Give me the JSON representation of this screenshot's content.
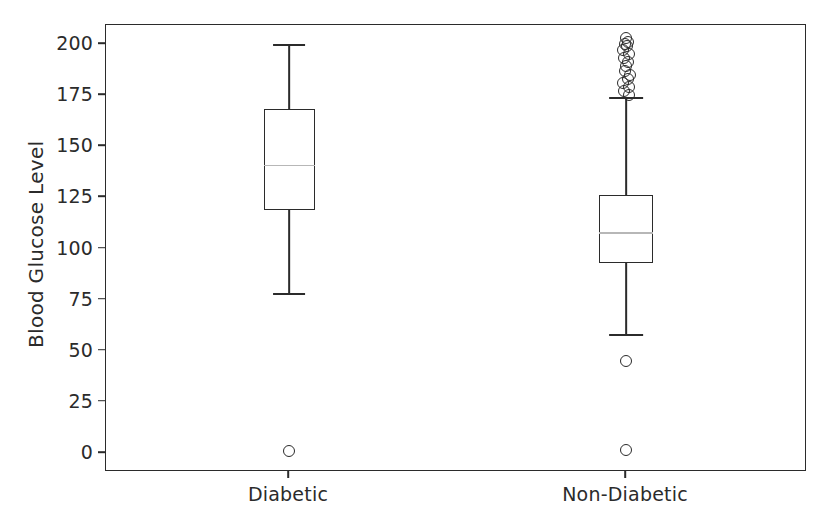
{
  "chart_data": {
    "type": "box",
    "title": "",
    "xlabel": "",
    "ylabel": "Blood Glucose Level",
    "categories": [
      "Diabetic",
      "Non-Diabetic"
    ],
    "ylim": [
      -10,
      209
    ],
    "yticks": [
      0,
      25,
      50,
      75,
      100,
      125,
      150,
      175,
      200
    ],
    "ytick_labels": [
      "0",
      "25",
      "50",
      "75",
      "100",
      "125",
      "150",
      "175",
      "200"
    ],
    "grid": false,
    "legend": null,
    "median_color": "#b7b7b7",
    "box_color": "#2b2b2b",
    "series": [
      {
        "name": "Diabetic",
        "whisker_low": 78,
        "q1": 119,
        "median": 141,
        "q3": 168,
        "whisker_high": 200,
        "outliers": [
          1
        ]
      },
      {
        "name": "Non-Diabetic",
        "whisker_low": 58,
        "q1": 93,
        "median": 108,
        "q3": 126,
        "whisker_high": 174,
        "outliers": [
          1.5,
          45,
          175,
          177,
          179,
          181,
          183,
          185,
          187,
          189,
          191,
          193,
          195,
          197,
          199,
          200,
          201,
          203
        ]
      }
    ]
  },
  "axis": {
    "ylabel": "Blood Glucose Level",
    "ytick_labels": [
      "200",
      "175",
      "150",
      "125",
      "100",
      "75",
      "50",
      "25",
      "0"
    ],
    "xtick_labels": [
      "Diabetic",
      "Non-Diabetic"
    ]
  }
}
